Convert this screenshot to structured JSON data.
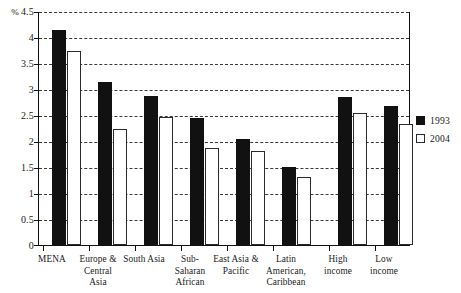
{
  "chart_data": {
    "type": "bar",
    "title": "",
    "xlabel": "",
    "ylabel": "%",
    "unit_label": "%",
    "ylim": [
      0,
      4.5
    ],
    "yticks": [
      0,
      0.5,
      1,
      1.5,
      2,
      2.5,
      3,
      3.5,
      4,
      4.5
    ],
    "ytick_labels": [
      "0",
      "0.5",
      "1",
      "1.5",
      "2",
      "2.5",
      "3",
      "3.5",
      "4",
      "4.5"
    ],
    "grid": true,
    "grid_style": "dashed-horizontal",
    "legend_position": "right",
    "categories": [
      "MENA",
      "Europe & Central Asia",
      "South Asia",
      "Sub-Saharan African",
      "East Asia & Pacific",
      "Latin American, Caribbean",
      "High income",
      "Low income"
    ],
    "series": [
      {
        "name": "1993",
        "color": "#111111",
        "values": [
          4.15,
          3.15,
          2.88,
          2.45,
          2.05,
          1.5,
          2.85,
          2.68
        ]
      },
      {
        "name": "2004",
        "color": "#ffffff",
        "values": [
          3.75,
          2.25,
          2.47,
          1.88,
          1.82,
          1.32,
          2.55,
          2.33
        ]
      }
    ]
  },
  "legend": {
    "entries": [
      {
        "label": "1993",
        "swatch": "filled-square-icon"
      },
      {
        "label": "2004",
        "swatch": "open-square-icon"
      }
    ]
  }
}
